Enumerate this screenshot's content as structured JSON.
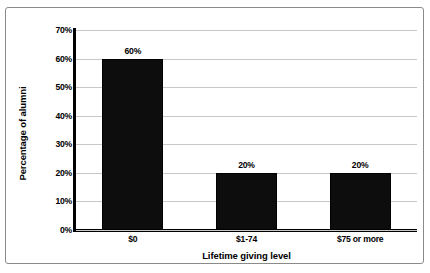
{
  "chart_data": {
    "type": "bar",
    "title": "",
    "categories": [
      "$0",
      "$1-74",
      "$75 or more"
    ],
    "values": [
      60,
      20,
      20
    ],
    "value_labels": [
      "60%",
      "20%",
      "20%"
    ],
    "xlabel": "Lifetime giving level",
    "ylabel": "Percentage of alumni",
    "ylim": [
      0,
      70
    ],
    "ytick_values": [
      0,
      10,
      20,
      30,
      40,
      50,
      60,
      70
    ],
    "ytick_labels": [
      "0%",
      "10%",
      "20%",
      "30%",
      "40%",
      "50%",
      "60%",
      "70%"
    ],
    "grid": "horizontal",
    "legend": "none",
    "bar_color": "#0d0d0d",
    "gridline_color": "#c8c8c8",
    "axis_color": "#000000",
    "border_color": "#8a8a8a",
    "background_color": "#ffffff"
  }
}
